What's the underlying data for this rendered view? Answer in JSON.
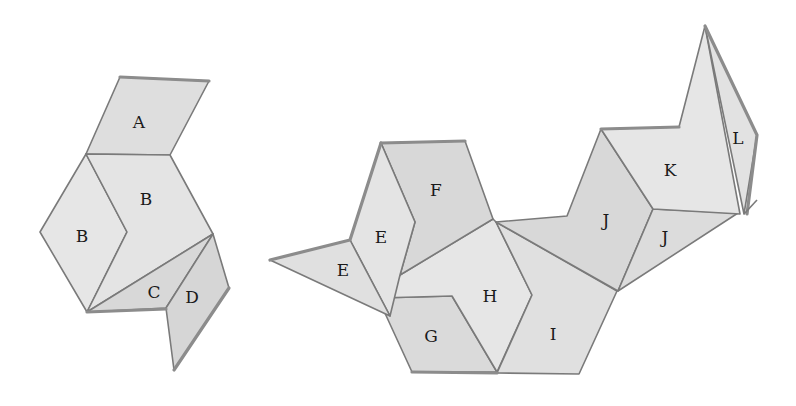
{
  "colors": {
    "background": "#ffffff",
    "face_light": "#e6e6e6",
    "face_mid": "#dcdcdc",
    "face_dark": "#d2d2d2",
    "stroke": "#7a7a7a"
  },
  "left_figure": {
    "labels": {
      "A": "A",
      "B_left": "B",
      "B_right": "B",
      "C": "C",
      "D": "D"
    }
  },
  "right_figure": {
    "labels": {
      "E_upper": "E",
      "E_lower": "E",
      "F": "F",
      "G": "G",
      "H": "H",
      "I": "I",
      "J_upper": "J",
      "J_lower": "J",
      "K": "K",
      "L": "L"
    }
  }
}
